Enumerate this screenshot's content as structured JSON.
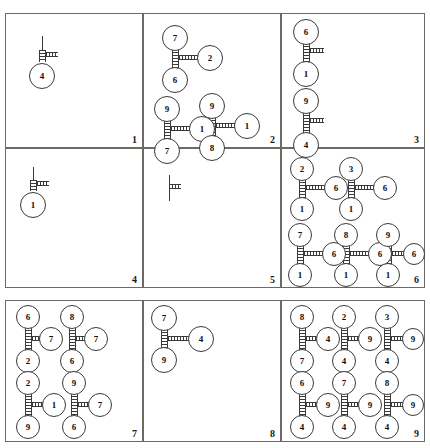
{
  "figure": {
    "type": "diagram-grid",
    "rows": 3,
    "cols": 3,
    "width": 430,
    "height": 448,
    "node_label_set": [
      "1",
      "2",
      "3",
      "4",
      "6",
      "7",
      "8",
      "9"
    ],
    "connector_style": "ladder",
    "stroke_color": "#3a3a3a",
    "panel_border_color": "#6b6b63",
    "background_color": "#ffffff"
  },
  "panels": [
    {
      "number": "1",
      "x": 5,
      "y": 13,
      "w": 138,
      "h": 135,
      "motifs": [
        {
          "kind": "stem-node",
          "stem": {
            "x": 36,
            "y": 22,
            "h": 14
          },
          "ladder_v": {
            "x": 33,
            "y": 36,
            "w": 7,
            "h": 12
          },
          "ladder_h": {
            "x": 40,
            "y": 38,
            "w": 12,
            "h": 5
          },
          "node": {
            "label": "4",
            "cx": 36,
            "cy": 62,
            "r": 13
          }
        }
      ]
    },
    {
      "number": "2",
      "x": 143,
      "y": 13,
      "w": 138,
      "h": 135,
      "motifs": [
        {
          "kind": "tee",
          "top": {
            "label": "7",
            "cx": 31,
            "cy": 24,
            "r": 13
          },
          "right": {
            "label": "2",
            "cx": 66,
            "cy": 44,
            "r": 13
          },
          "bottom": {
            "label": "6",
            "cx": 31,
            "cy": 66,
            "r": 13
          },
          "ladder_v": {
            "x": 28,
            "y": 35,
            "w": 7,
            "h": 22
          },
          "ladder_h": {
            "x": 35,
            "y": 41,
            "w": 19,
            "h": 5
          }
        },
        {
          "kind": "tee",
          "top": {
            "label": "9",
            "cx": 23,
            "cy": 95,
            "r": 13
          },
          "right": {
            "label": "1",
            "cx": 58,
            "cy": 115,
            "r": 13
          },
          "bottom": {
            "label": "7",
            "cx": 23,
            "cy": 137,
            "r": 13
          },
          "ladder_v": {
            "x": 20,
            "y": 106,
            "w": 7,
            "h": 22
          },
          "ladder_h": {
            "x": 27,
            "y": 112,
            "w": 19,
            "h": 5
          }
        },
        {
          "kind": "tee",
          "top": {
            "label": "9",
            "cx": 68,
            "cy": 92,
            "r": 13
          },
          "right": {
            "label": "1",
            "cx": 103,
            "cy": 112,
            "r": 13
          },
          "bottom": {
            "label": "8",
            "cx": 68,
            "cy": 134,
            "r": 13
          },
          "ladder_v": {
            "x": 65,
            "y": 103,
            "w": 7,
            "h": 22
          },
          "ladder_h": {
            "x": 72,
            "y": 109,
            "w": 19,
            "h": 5
          }
        }
      ]
    },
    {
      "number": "3",
      "x": 281,
      "y": 13,
      "w": 144,
      "h": 135,
      "motifs": [
        {
          "kind": "tee",
          "top": {
            "label": "6",
            "cx": 24,
            "cy": 18,
            "r": 13
          },
          "right": null,
          "bottom": {
            "label": "1",
            "cx": 24,
            "cy": 60,
            "r": 13
          },
          "ladder_v": {
            "x": 21,
            "y": 29,
            "w": 7,
            "h": 22
          },
          "ladder_h": {
            "x": 28,
            "y": 34,
            "w": 14,
            "h": 5
          }
        },
        {
          "kind": "tee",
          "top": {
            "label": "9",
            "cx": 24,
            "cy": 87,
            "r": 13
          },
          "right": null,
          "bottom": {
            "label": "4",
            "cx": 24,
            "cy": 131,
            "r": 13
          },
          "ladder_v": {
            "x": 21,
            "y": 98,
            "w": 7,
            "h": 24
          },
          "ladder_h": {
            "x": 28,
            "y": 104,
            "w": 14,
            "h": 5
          }
        }
      ]
    },
    {
      "number": "4",
      "x": 5,
      "y": 148,
      "w": 138,
      "h": 140,
      "motifs": [
        {
          "kind": "stem-node",
          "stem": {
            "x": 27,
            "y": 18,
            "h": 13
          },
          "ladder_v": {
            "x": 24,
            "y": 31,
            "w": 7,
            "h": 11
          },
          "ladder_h": {
            "x": 31,
            "y": 32,
            "w": 12,
            "h": 5
          },
          "node": {
            "label": "1",
            "cx": 27,
            "cy": 56,
            "r": 13
          }
        }
      ]
    },
    {
      "number": "5",
      "x": 143,
      "y": 148,
      "w": 138,
      "h": 140,
      "motifs": [
        {
          "kind": "stem-only",
          "stem": {
            "x": 25,
            "y": 26,
            "h": 26
          },
          "ladder_h": {
            "x": 25,
            "y": 35,
            "w": 12,
            "h": 5
          }
        }
      ]
    },
    {
      "number": "6",
      "x": 281,
      "y": 148,
      "w": 144,
      "h": 140,
      "motifs": [
        {
          "kind": "tee",
          "top": {
            "label": "2",
            "cx": 20,
            "cy": 20,
            "r": 12
          },
          "right": {
            "label": "6",
            "cx": 54,
            "cy": 39,
            "r": 12
          },
          "bottom": {
            "label": "1",
            "cx": 20,
            "cy": 60,
            "r": 12
          },
          "ladder_v": {
            "x": 17,
            "y": 30,
            "w": 7,
            "h": 21
          },
          "ladder_h": {
            "x": 24,
            "y": 36,
            "w": 19,
            "h": 5
          }
        },
        {
          "kind": "tee",
          "top": {
            "label": "3",
            "cx": 69,
            "cy": 20,
            "r": 12
          },
          "right": {
            "label": "6",
            "cx": 103,
            "cy": 39,
            "r": 12
          },
          "bottom": {
            "label": "1",
            "cx": 69,
            "cy": 60,
            "r": 12
          },
          "ladder_v": {
            "x": 66,
            "y": 30,
            "w": 7,
            "h": 21
          },
          "ladder_h": {
            "x": 73,
            "y": 36,
            "w": 19,
            "h": 5
          }
        },
        {
          "kind": "tee",
          "top": {
            "label": "7",
            "cx": 18,
            "cy": 86,
            "r": 12
          },
          "right": {
            "label": "6",
            "cx": 52,
            "cy": 105,
            "r": 12
          },
          "bottom": {
            "label": "1",
            "cx": 18,
            "cy": 126,
            "r": 12
          },
          "ladder_v": {
            "x": 15,
            "y": 96,
            "w": 7,
            "h": 21
          },
          "ladder_h": {
            "x": 22,
            "y": 102,
            "w": 19,
            "h": 5
          }
        },
        {
          "kind": "tee",
          "top": {
            "label": "8",
            "cx": 64,
            "cy": 86,
            "r": 12
          },
          "right": {
            "label": "6",
            "cx": 98,
            "cy": 105,
            "r": 12
          },
          "bottom": {
            "label": "1",
            "cx": 64,
            "cy": 126,
            "r": 12
          },
          "ladder_v": {
            "x": 61,
            "y": 96,
            "w": 7,
            "h": 21
          },
          "ladder_h": {
            "x": 68,
            "y": 102,
            "w": 19,
            "h": 5
          }
        },
        {
          "kind": "tee",
          "top": {
            "label": "9",
            "cx": 106,
            "cy": 86,
            "r": 12
          },
          "right": {
            "label": "6",
            "cx": 132,
            "cy": 105,
            "r": 11
          },
          "bottom": {
            "label": "1",
            "cx": 106,
            "cy": 126,
            "r": 12
          },
          "ladder_v": {
            "x": 103,
            "y": 96,
            "w": 7,
            "h": 21
          },
          "ladder_h": {
            "x": 110,
            "y": 102,
            "w": 13,
            "h": 5
          }
        }
      ]
    },
    {
      "number": "7",
      "x": 5,
      "y": 300,
      "w": 138,
      "h": 142,
      "motifs": [
        {
          "kind": "tee",
          "top": {
            "label": "6",
            "cx": 22,
            "cy": 16,
            "r": 12
          },
          "right": {
            "label": "7",
            "cx": 45,
            "cy": 38,
            "r": 12
          },
          "bottom": {
            "label": "2",
            "cx": 22,
            "cy": 60,
            "r": 12
          },
          "ladder_v": {
            "x": 19,
            "y": 26,
            "w": 7,
            "h": 23
          },
          "ladder_h": {
            "x": 26,
            "y": 35,
            "w": 12,
            "h": 5
          }
        },
        {
          "kind": "tee",
          "top": {
            "label": "8",
            "cx": 66,
            "cy": 16,
            "r": 12
          },
          "right": {
            "label": "7",
            "cx": 90,
            "cy": 38,
            "r": 12
          },
          "bottom": {
            "label": "6",
            "cx": 66,
            "cy": 60,
            "r": 12
          },
          "ladder_v": {
            "x": 63,
            "y": 26,
            "w": 7,
            "h": 23
          },
          "ladder_h": {
            "x": 70,
            "y": 35,
            "w": 13,
            "h": 5
          }
        },
        {
          "kind": "tee",
          "top": {
            "label": "2",
            "cx": 22,
            "cy": 82,
            "r": 12
          },
          "right": {
            "label": "1",
            "cx": 48,
            "cy": 104,
            "r": 12
          },
          "bottom": {
            "label": "9",
            "cx": 22,
            "cy": 126,
            "r": 12
          },
          "ladder_v": {
            "x": 19,
            "y": 92,
            "w": 7,
            "h": 24
          },
          "ladder_h": {
            "x": 26,
            "y": 101,
            "w": 14,
            "h": 5
          }
        },
        {
          "kind": "tee",
          "top": {
            "label": "9",
            "cx": 68,
            "cy": 82,
            "r": 12
          },
          "right": {
            "label": "7",
            "cx": 94,
            "cy": 104,
            "r": 12
          },
          "bottom": {
            "label": "6",
            "cx": 68,
            "cy": 126,
            "r": 12
          },
          "ladder_v": {
            "x": 65,
            "y": 92,
            "w": 7,
            "h": 24
          },
          "ladder_h": {
            "x": 72,
            "y": 101,
            "w": 14,
            "h": 5
          }
        }
      ]
    },
    {
      "number": "8",
      "x": 143,
      "y": 300,
      "w": 138,
      "h": 142,
      "motifs": [
        {
          "kind": "tee",
          "top": {
            "label": "7",
            "cx": 20,
            "cy": 17,
            "r": 13
          },
          "right": {
            "label": "4",
            "cx": 57,
            "cy": 38,
            "r": 13
          },
          "bottom": {
            "label": "9",
            "cx": 20,
            "cy": 59,
            "r": 13
          },
          "ladder_v": {
            "x": 17,
            "y": 28,
            "w": 7,
            "h": 22
          },
          "ladder_h": {
            "x": 24,
            "y": 35,
            "w": 21,
            "h": 5
          }
        }
      ]
    },
    {
      "number": "9",
      "x": 281,
      "y": 300,
      "w": 144,
      "h": 142,
      "motifs": [
        {
          "kind": "tee",
          "top": {
            "label": "8",
            "cx": 20,
            "cy": 16,
            "r": 12
          },
          "right": {
            "label": "4",
            "cx": 46,
            "cy": 38,
            "r": 12
          },
          "bottom": {
            "label": "7",
            "cx": 20,
            "cy": 60,
            "r": 12
          },
          "ladder_v": {
            "x": 17,
            "y": 26,
            "w": 7,
            "h": 23
          },
          "ladder_h": {
            "x": 24,
            "y": 35,
            "w": 14,
            "h": 5
          }
        },
        {
          "kind": "tee",
          "top": {
            "label": "2",
            "cx": 62,
            "cy": 16,
            "r": 12
          },
          "right": {
            "label": "9",
            "cx": 88,
            "cy": 38,
            "r": 12
          },
          "bottom": {
            "label": "4",
            "cx": 62,
            "cy": 60,
            "r": 12
          },
          "ladder_v": {
            "x": 59,
            "y": 26,
            "w": 7,
            "h": 23
          },
          "ladder_h": {
            "x": 66,
            "y": 35,
            "w": 14,
            "h": 5
          }
        },
        {
          "kind": "tee",
          "top": {
            "label": "3",
            "cx": 105,
            "cy": 16,
            "r": 12
          },
          "right": {
            "label": "9",
            "cx": 131,
            "cy": 38,
            "r": 11
          },
          "bottom": {
            "label": "4",
            "cx": 105,
            "cy": 60,
            "r": 12
          },
          "ladder_v": {
            "x": 102,
            "y": 26,
            "w": 7,
            "h": 23
          },
          "ladder_h": {
            "x": 109,
            "y": 35,
            "w": 13,
            "h": 5
          }
        },
        {
          "kind": "tee",
          "top": {
            "label": "6",
            "cx": 20,
            "cy": 82,
            "r": 12
          },
          "right": {
            "label": "9",
            "cx": 46,
            "cy": 104,
            "r": 12
          },
          "bottom": {
            "label": "4",
            "cx": 20,
            "cy": 126,
            "r": 12
          },
          "ladder_v": {
            "x": 17,
            "y": 92,
            "w": 7,
            "h": 24
          },
          "ladder_h": {
            "x": 24,
            "y": 101,
            "w": 14,
            "h": 5
          }
        },
        {
          "kind": "tee",
          "top": {
            "label": "7",
            "cx": 62,
            "cy": 82,
            "r": 12
          },
          "right": {
            "label": "9",
            "cx": 88,
            "cy": 104,
            "r": 12
          },
          "bottom": {
            "label": "4",
            "cx": 62,
            "cy": 126,
            "r": 12
          },
          "ladder_v": {
            "x": 59,
            "y": 92,
            "w": 7,
            "h": 24
          },
          "ladder_h": {
            "x": 66,
            "y": 101,
            "w": 14,
            "h": 5
          }
        },
        {
          "kind": "tee",
          "top": {
            "label": "8",
            "cx": 105,
            "cy": 82,
            "r": 12
          },
          "right": {
            "label": "9",
            "cx": 131,
            "cy": 104,
            "r": 11
          },
          "bottom": {
            "label": "4",
            "cx": 105,
            "cy": 126,
            "r": 12
          },
          "ladder_v": {
            "x": 102,
            "y": 92,
            "w": 7,
            "h": 24
          },
          "ladder_h": {
            "x": 109,
            "y": 101,
            "w": 13,
            "h": 5
          }
        }
      ]
    }
  ]
}
